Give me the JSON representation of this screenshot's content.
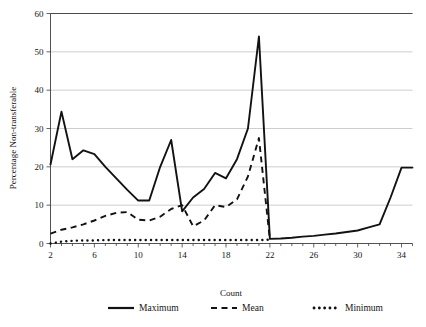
{
  "chart_data": {
    "type": "line",
    "title": "",
    "xlabel": "Count",
    "ylabel": "Percentage Non-transferable",
    "xlim": [
      2,
      35
    ],
    "ylim": [
      0,
      60
    ],
    "xticks": [
      2,
      6,
      10,
      14,
      18,
      22,
      26,
      30,
      34
    ],
    "xtick_labels": [
      "2",
      "6",
      "10",
      "14",
      "18",
      "22",
      "26",
      "30",
      "34"
    ],
    "x_minor_tick_step": 1,
    "yticks": [
      0,
      10,
      20,
      30,
      40,
      50,
      60
    ],
    "ytick_labels": [
      "0",
      "10",
      "20",
      "30",
      "40",
      "50",
      "60"
    ],
    "grid": "horizontal",
    "legend_position": "bottom",
    "x": [
      2,
      3,
      4,
      5,
      6,
      7,
      8,
      9,
      10,
      11,
      12,
      13,
      14,
      15,
      16,
      17,
      18,
      19,
      20,
      21,
      22,
      23,
      24,
      25,
      26,
      27,
      28,
      29,
      30,
      31,
      32,
      33,
      34,
      35
    ],
    "series": [
      {
        "name": "Maximum",
        "style": "solid",
        "values": [
          20.6,
          34.4,
          22.0,
          24.3,
          23.3,
          20.0,
          17.0,
          14.0,
          11.2,
          11.2,
          20.0,
          27.0,
          8.4,
          12.0,
          14.2,
          18.4,
          17.0,
          22.0,
          30.0,
          54.0,
          1.2,
          1.3,
          1.5,
          1.8,
          2.0,
          2.3,
          2.6,
          3.0,
          3.4,
          4.2,
          5.0,
          12.0,
          19.8,
          19.8
        ]
      },
      {
        "name": "Mean",
        "style": "dashed",
        "values": [
          2.6,
          3.6,
          4.2,
          5.0,
          6.0,
          7.2,
          8.0,
          8.2,
          6.2,
          6.0,
          7.0,
          9.0,
          10.0,
          4.5,
          6.0,
          10.0,
          9.5,
          11.5,
          17.5,
          27.5,
          1.0,
          null,
          null,
          null,
          null,
          null,
          null,
          null,
          null,
          null,
          null,
          null,
          null,
          null
        ]
      },
      {
        "name": "Minimum",
        "style": "dotted",
        "values": [
          0.0,
          0.5,
          0.7,
          0.8,
          0.8,
          0.9,
          0.9,
          0.9,
          0.9,
          0.9,
          0.9,
          0.9,
          0.9,
          0.9,
          0.9,
          0.9,
          0.9,
          0.9,
          0.9,
          0.9,
          1.0,
          null,
          null,
          null,
          null,
          null,
          null,
          null,
          null,
          null,
          null,
          null,
          null,
          null
        ]
      }
    ]
  },
  "legend": {
    "items": [
      {
        "label": "Maximum",
        "style": "solid"
      },
      {
        "label": "Mean",
        "style": "dashed"
      },
      {
        "label": "Minimum",
        "style": "dotted"
      }
    ]
  }
}
